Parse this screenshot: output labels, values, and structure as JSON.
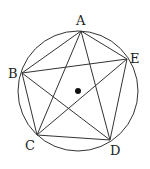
{
  "diagram": {
    "type": "circle-inscribed-pentagon-with-star",
    "circle": {
      "cx": 78,
      "cy": 91,
      "r": 60
    },
    "center_dot": {
      "cx": 78,
      "cy": 91,
      "r": 3
    },
    "points": [
      {
        "label": "A",
        "x": 81,
        "y": 31,
        "lx": 76,
        "ly": 25
      },
      {
        "label": "B",
        "x": 22,
        "y": 73,
        "lx": 8,
        "ly": 78
      },
      {
        "label": "C",
        "x": 37,
        "y": 135,
        "lx": 25,
        "ly": 150
      },
      {
        "label": "D",
        "x": 110,
        "y": 140,
        "lx": 110,
        "ly": 155
      },
      {
        "label": "E",
        "x": 127,
        "y": 59,
        "lx": 130,
        "ly": 63
      }
    ],
    "edges": [
      [
        "A",
        "B"
      ],
      [
        "B",
        "C"
      ],
      [
        "C",
        "D"
      ],
      [
        "D",
        "E"
      ],
      [
        "E",
        "A"
      ],
      [
        "A",
        "C"
      ],
      [
        "A",
        "D"
      ],
      [
        "B",
        "D"
      ],
      [
        "B",
        "E"
      ],
      [
        "C",
        "E"
      ]
    ],
    "stroke_color": "#333333"
  }
}
